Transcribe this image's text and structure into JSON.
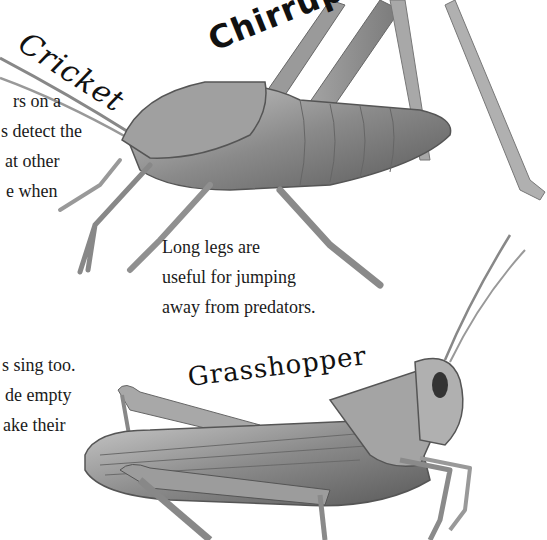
{
  "page": {
    "cricket_heading": "Cricket",
    "sound_word": "Chirrup",
    "grasshopper_heading": "Grasshopper",
    "left_text_top": {
      "lines": [
        "rs on a",
        "s detect the",
        "at other",
        "e when"
      ]
    },
    "caption_legs": {
      "lines": [
        "Long legs are",
        "useful for jumping",
        "away from predators."
      ]
    },
    "left_text_bottom": {
      "lines": [
        "s sing too.",
        "de empty",
        "ake their"
      ]
    },
    "illustrations": [
      {
        "name": "cricket-illustration",
        "subject": "bush cricket"
      },
      {
        "name": "grasshopper-illustration",
        "subject": "grasshopper"
      }
    ]
  }
}
